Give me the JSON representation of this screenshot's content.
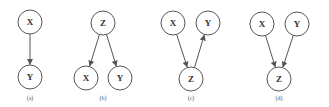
{
  "diagram": {
    "type": "causal-graphs",
    "node_radius": 12,
    "stroke_color": "#555555",
    "panels": [
      {
        "id": "a",
        "caption": "(a)",
        "caption_pos": [
          30,
          100
        ],
        "nodes": [
          {
            "id": "X",
            "label": "X",
            "x": 30,
            "y": 22
          },
          {
            "id": "Y",
            "label": "Y",
            "x": 30,
            "y": 77
          }
        ],
        "edges": [
          {
            "from": "X",
            "to": "Y"
          }
        ]
      },
      {
        "id": "b",
        "caption": "(b)",
        "caption_pos": [
          103,
          100
        ],
        "nodes": [
          {
            "id": "Z",
            "label": "Z",
            "x": 103,
            "y": 23
          },
          {
            "id": "X",
            "label": "X",
            "x": 86,
            "y": 78
          },
          {
            "id": "Y",
            "label": "Y",
            "x": 120,
            "y": 78
          }
        ],
        "edges": [
          {
            "from": "Z",
            "to": "X"
          },
          {
            "from": "Z",
            "to": "Y"
          }
        ]
      },
      {
        "id": "c",
        "caption": "(c)",
        "caption_pos": [
          191,
          100
        ],
        "nodes": [
          {
            "id": "X",
            "label": "X",
            "x": 173,
            "y": 23
          },
          {
            "id": "Y",
            "label": "Y",
            "x": 208,
            "y": 23
          },
          {
            "id": "Z",
            "label": "Z",
            "x": 191,
            "y": 79
          }
        ],
        "edges": [
          {
            "from": "X",
            "to": "Z"
          },
          {
            "from": "Z",
            "to": "Y"
          }
        ]
      },
      {
        "id": "d",
        "caption": "(d)",
        "caption_pos": [
          279,
          100
        ],
        "nodes": [
          {
            "id": "X",
            "label": "X",
            "x": 262,
            "y": 24
          },
          {
            "id": "Y",
            "label": "Y",
            "x": 297,
            "y": 24
          },
          {
            "id": "Z",
            "label": "Z",
            "x": 279,
            "y": 79
          }
        ],
        "edges": [
          {
            "from": "X",
            "to": "Z"
          },
          {
            "from": "Y",
            "to": "Z"
          }
        ]
      }
    ]
  }
}
